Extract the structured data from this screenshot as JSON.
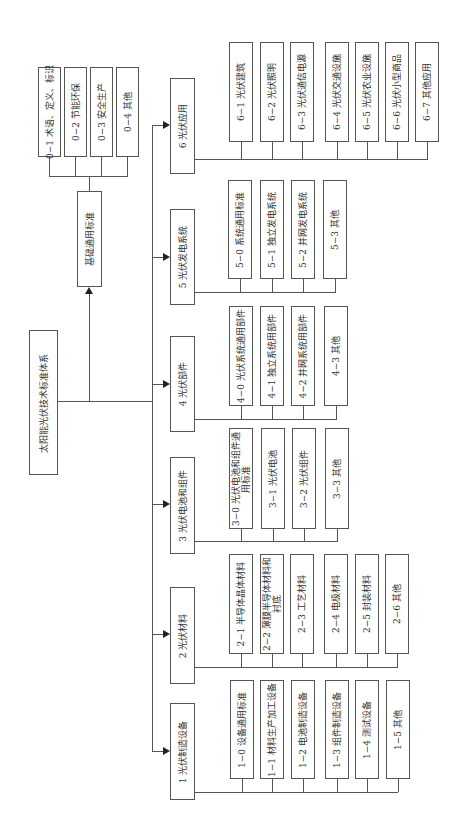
{
  "diagram": {
    "root": {
      "label": "太阳能光伏技术标准体系"
    },
    "general": {
      "label": "基础通用标准",
      "children": [
        {
          "label": "0−1 术语、定义、标识"
        },
        {
          "label": "0−2 节能环保"
        },
        {
          "label": "0−3 安全生产"
        },
        {
          "label": "0−4 其他"
        }
      ]
    },
    "categories": [
      {
        "label": "6  光伏应用",
        "children": [
          {
            "label": "6−1 光伏建筑"
          },
          {
            "label": "6−2 光伏照明"
          },
          {
            "label": "6−3 光伏通信电源"
          },
          {
            "label": "6−4 光伏交通设施"
          },
          {
            "label": "6−5 光伏农业设施"
          },
          {
            "label": "6−6 光伏小型商品"
          },
          {
            "label": "6−7 其他应用"
          }
        ]
      },
      {
        "label": "5  光伏发电系统",
        "children": [
          {
            "label": "5−0 系统通用标准"
          },
          {
            "label": "5−1 独立发电系统"
          },
          {
            "label": "5−2 并网发电系统"
          },
          {
            "label": "5−3 其他"
          }
        ]
      },
      {
        "label": "4  光伏部件",
        "children": [
          {
            "label": "4−0 光伏系统通用部件"
          },
          {
            "label": "4−1 独立系统用部件"
          },
          {
            "label": "4−2 并网系统用部件"
          },
          {
            "label": "4−3 其他"
          }
        ]
      },
      {
        "label": "3  光伏电池和组件",
        "children": [
          {
            "label": "3−0 光伏电池和组件通用标准"
          },
          {
            "label": "3−1 光伏电池"
          },
          {
            "label": "3−2 光伏组件"
          },
          {
            "label": "3−3 其他"
          }
        ]
      },
      {
        "label": "2  光伏材料",
        "children": [
          {
            "label": "2−1 半导体晶体材料"
          },
          {
            "label": "2−2 薄膜半导体材料和衬底"
          },
          {
            "label": "2−3 工艺材料"
          },
          {
            "label": "2−4 电极材料"
          },
          {
            "label": "2−5 封装材料"
          },
          {
            "label": "2−6 其他"
          }
        ]
      },
      {
        "label": "1  光伏制造设备",
        "children": [
          {
            "label": "1−0 设备通用标准"
          },
          {
            "label": "1−1 材料生产加工设备"
          },
          {
            "label": "1−2 电池制造设备"
          },
          {
            "label": "1−3 组件制造设备"
          },
          {
            "label": "1−4 测试设备"
          },
          {
            "label": "1−5 其他"
          }
        ]
      }
    ]
  }
}
